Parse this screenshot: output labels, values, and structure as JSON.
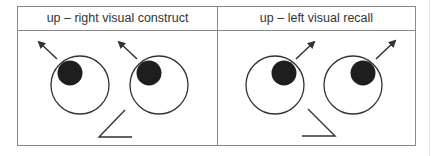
{
  "diagram": {
    "panels": [
      {
        "label": "up – right visual construct",
        "gaze": "up-left-arrow",
        "mouth": "left-open"
      },
      {
        "label": "up – left visual recall",
        "gaze": "up-right-arrow",
        "mouth": "right-open"
      }
    ],
    "colors": {
      "border": "#8a8a8a",
      "stroke": "#333333",
      "pupil": "#1e1e1e"
    }
  }
}
